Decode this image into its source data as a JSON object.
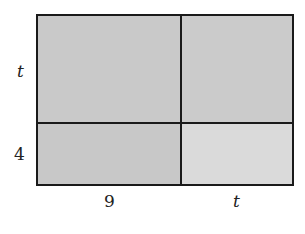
{
  "diagram": {
    "type": "area-model-rectangle",
    "side_labels": {
      "left_top": "t",
      "left_bottom": "4",
      "bottom_left": "9",
      "bottom_right": "t"
    },
    "regions": [
      {
        "position": "top-left",
        "width_label": "9",
        "height_label": "t",
        "fill": "#c9c9c9"
      },
      {
        "position": "top-right",
        "width_label": "t",
        "height_label": "t",
        "fill": "#cbcbcb"
      },
      {
        "position": "bottom-left",
        "width_label": "9",
        "height_label": "4",
        "fill": "#c8c8c8"
      },
      {
        "position": "bottom-right",
        "width_label": "t",
        "height_label": "4",
        "fill": "#dadada"
      }
    ],
    "line_color": "#1a1a1a"
  }
}
